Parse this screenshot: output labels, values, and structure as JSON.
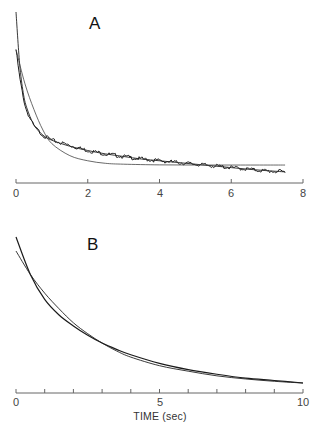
{
  "chart_data": [
    {
      "panel": "A",
      "type": "line",
      "title": "A",
      "xlabel": "",
      "ylabel": "",
      "xlim": [
        0,
        8
      ],
      "xticks": [
        0,
        2,
        4,
        6,
        8
      ],
      "ylim": [
        0,
        1
      ],
      "grid": false,
      "legend": null,
      "series": [
        {
          "name": "data (noisy trace)",
          "x": [
            0.0,
            0.1,
            0.2,
            0.3,
            0.5,
            0.75,
            1.0,
            1.5,
            2.0,
            2.5,
            3.0,
            3.5,
            4.0,
            4.5,
            5.0,
            5.5,
            6.0,
            6.5,
            7.0,
            7.5
          ],
          "y": [
            0.78,
            0.62,
            0.5,
            0.42,
            0.33,
            0.28,
            0.25,
            0.22,
            0.19,
            0.17,
            0.155,
            0.14,
            0.13,
            0.12,
            0.11,
            0.1,
            0.09,
            0.08,
            0.07,
            0.065
          ]
        },
        {
          "name": "multi-exponential fit",
          "x": [
            0.0,
            0.1,
            0.2,
            0.3,
            0.5,
            0.75,
            1.0,
            1.5,
            2.0,
            2.5,
            3.0,
            3.5,
            4.0,
            4.5,
            5.0,
            5.5,
            6.0,
            6.5,
            7.0,
            7.5
          ],
          "y": [
            1.0,
            0.7,
            0.53,
            0.44,
            0.34,
            0.28,
            0.25,
            0.215,
            0.19,
            0.17,
            0.155,
            0.14,
            0.13,
            0.12,
            0.11,
            0.1,
            0.09,
            0.08,
            0.072,
            0.065
          ]
        },
        {
          "name": "single-exponential fit",
          "x": [
            0.0,
            0.25,
            0.5,
            0.75,
            1.0,
            1.5,
            2.0,
            2.5,
            3.0,
            4.0,
            5.0,
            6.0,
            7.0,
            7.5
          ],
          "y": [
            0.78,
            0.58,
            0.43,
            0.31,
            0.23,
            0.16,
            0.13,
            0.115,
            0.11,
            0.106,
            0.105,
            0.105,
            0.105,
            0.105
          ]
        }
      ]
    },
    {
      "panel": "B",
      "type": "line",
      "title": "B",
      "xlabel": "TIME (sec)",
      "ylabel": "",
      "xlim": [
        0,
        10
      ],
      "xticks": [
        0,
        1,
        2,
        3,
        4,
        5,
        6,
        7,
        8,
        9,
        10
      ],
      "xticklabels": [
        "0",
        "",
        "",
        "",
        "",
        "5",
        "",
        "",
        "",
        "",
        "10"
      ],
      "ylim": [
        0,
        1
      ],
      "grid": false,
      "legend": null,
      "series": [
        {
          "name": "data",
          "x": [
            0.0,
            0.5,
            1.0,
            1.5,
            2.0,
            2.5,
            3.0,
            3.5,
            4.0,
            5.0,
            6.0,
            7.0,
            8.0,
            9.0,
            10.0
          ],
          "y": [
            1.0,
            0.76,
            0.6,
            0.5,
            0.43,
            0.37,
            0.32,
            0.28,
            0.245,
            0.19,
            0.15,
            0.12,
            0.095,
            0.08,
            0.064
          ]
        },
        {
          "name": "fit",
          "x": [
            0.0,
            0.5,
            1.0,
            1.5,
            2.0,
            2.5,
            3.0,
            3.5,
            4.0,
            5.0,
            6.0,
            7.0,
            8.0,
            9.0,
            10.0
          ],
          "y": [
            0.91,
            0.76,
            0.64,
            0.54,
            0.45,
            0.38,
            0.32,
            0.27,
            0.23,
            0.175,
            0.14,
            0.11,
            0.09,
            0.075,
            0.064
          ]
        }
      ]
    }
  ],
  "labels": {
    "panel_a": "A",
    "panel_b": "B",
    "a_ticks": [
      "0",
      "2",
      "4",
      "6",
      "8"
    ],
    "b_ticks": [
      "0",
      "5",
      "10"
    ],
    "b_xlabel": "TIME (sec)"
  },
  "colors": {
    "line": "#1a1a1a",
    "fit_light": "#555555",
    "axis": "#555555"
  }
}
